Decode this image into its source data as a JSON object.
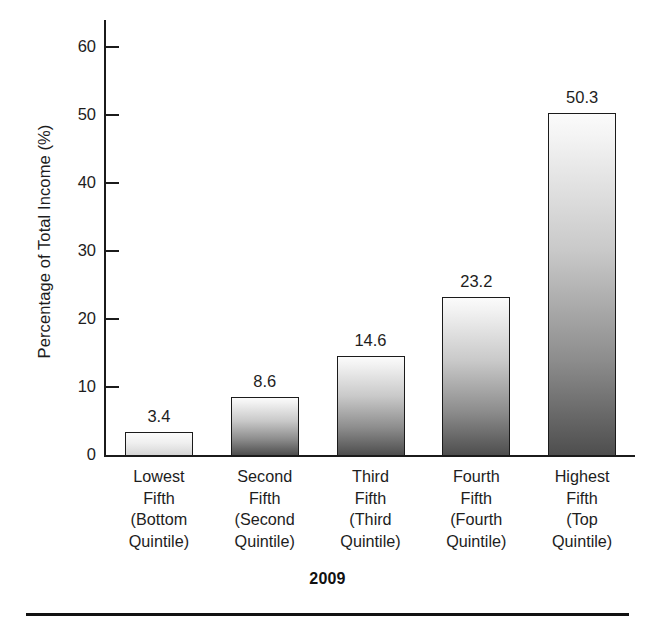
{
  "chart_data": {
    "type": "bar",
    "title": "",
    "xlabel": "2009",
    "ylabel": "Percentage of Total Income (%)",
    "categories": [
      "Lowest Fifth (Bottom Quintile)",
      "Second Fifth (Second Quintile)",
      "Third Fifth (Third Quintile)",
      "Fourth Fifth (Fourth Quintile)",
      "Highest Fifth (Top Quintile)"
    ],
    "category_lines": [
      [
        "Lowest",
        "Fifth",
        "(Bottom",
        "Quintile)"
      ],
      [
        "Second",
        "Fifth",
        "(Second",
        "Quintile)"
      ],
      [
        "Third",
        "Fifth",
        "(Third",
        "Quintile)"
      ],
      [
        "Fourth",
        "Fifth",
        "(Fourth",
        "Quintile)"
      ],
      [
        "Highest",
        "Fifth",
        "(Top",
        "Quintile)"
      ]
    ],
    "values": [
      3.4,
      8.6,
      14.6,
      23.2,
      50.3
    ],
    "value_labels": [
      "3.4",
      "8.6",
      "14.6",
      "23.2",
      "50.3"
    ],
    "ylim": [
      0,
      64
    ],
    "yticks": [
      0,
      10,
      20,
      30,
      40,
      50,
      60
    ],
    "ytick_labels": [
      "0",
      "10",
      "20",
      "30",
      "40",
      "50",
      "60"
    ],
    "grid": false,
    "legend": "none",
    "bar_fill": "linear-gradient light-to-dark gray",
    "bar_edge_color": "#1b1b1b"
  },
  "axis": {
    "y_title": "Percentage of Total Income (%)",
    "ticks": [
      {
        "label": "60",
        "value": 60
      },
      {
        "label": "50",
        "value": 50
      },
      {
        "label": "40",
        "value": 40
      },
      {
        "label": "30",
        "value": 30
      },
      {
        "label": "20",
        "value": 20
      },
      {
        "label": "10",
        "value": 10
      },
      {
        "label": "0",
        "value": 0
      }
    ]
  },
  "footer": {
    "year": "2009"
  }
}
